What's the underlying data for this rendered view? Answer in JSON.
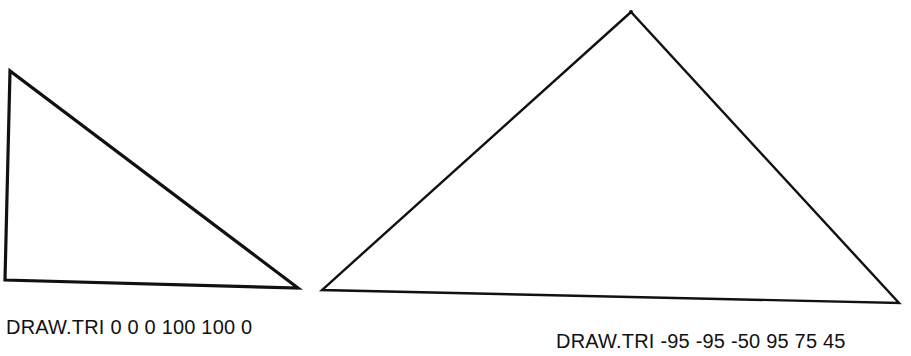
{
  "figures": [
    {
      "caption": "DRAW.TRI 0 0 0 100 100 0",
      "command": "DRAW.TRI",
      "args": [
        0,
        0,
        0,
        100,
        100,
        0
      ],
      "stroke_width": 3.2,
      "vertices_px": [
        [
          10,
          71
        ],
        [
          5,
          280
        ],
        [
          298,
          288
        ]
      ]
    },
    {
      "caption": "DRAW.TRI -95 -95 -50 95 75 45",
      "command": "DRAW.TRI",
      "args": [
        -95,
        -95,
        -50,
        95,
        75,
        45
      ],
      "stroke_width": 2.4,
      "vertices_px": [
        [
          631,
          12
        ],
        [
          322,
          290
        ],
        [
          899,
          303
        ]
      ]
    }
  ],
  "colors": {
    "stroke": "#111111",
    "background": "#ffffff",
    "text": "#111111"
  }
}
